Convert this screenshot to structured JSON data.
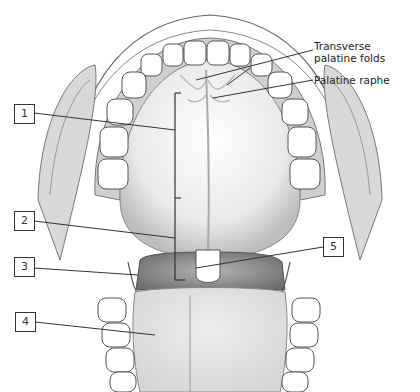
{
  "figure": {
    "labels": [
      {
        "id": "label-1",
        "text": "1"
      },
      {
        "id": "label-2",
        "text": "2"
      },
      {
        "id": "label-3",
        "text": "3"
      },
      {
        "id": "label-4",
        "text": "4"
      },
      {
        "id": "label-5",
        "text": "5"
      }
    ],
    "callouts": {
      "transverse_line1": "Transverse",
      "transverse_line2": "palatine folds",
      "palatine_raphe": "Palatine raphe"
    }
  }
}
